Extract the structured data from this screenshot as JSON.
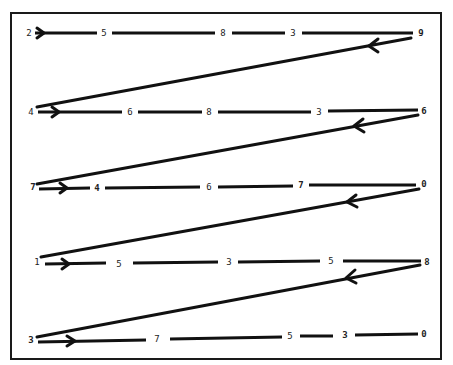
{
  "diagram": {
    "title": "",
    "colors": {
      "line": "#111111",
      "text": "#222222",
      "background": "#ffffff",
      "frame": "#1a1a1a"
    },
    "rows": [
      {
        "digits": [
          "2",
          "5",
          "8",
          "3",
          "9"
        ]
      },
      {
        "digits": [
          "4",
          "6",
          "8",
          "3",
          "6"
        ]
      },
      {
        "digits": [
          "7",
          "4",
          "6",
          "7",
          "0"
        ]
      },
      {
        "digits": [
          "1",
          "5",
          "3",
          "5",
          "8"
        ]
      },
      {
        "digits": [
          "3",
          "7",
          "5",
          "3",
          "0"
        ]
      }
    ],
    "arrows": {
      "row_arrow_icon": "right-arrow-icon",
      "return_arrow_icon": "left-arrow-icon"
    }
  }
}
